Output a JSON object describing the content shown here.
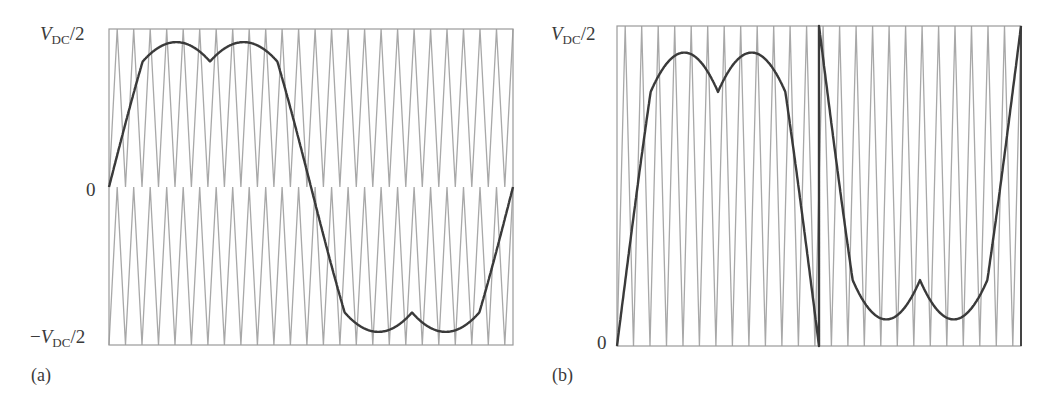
{
  "chart_data": [
    {
      "panel": "(a)",
      "type": "line",
      "title": "",
      "xlabel": "",
      "ylabel": "",
      "yticks": [
        "V_DC/2",
        "0",
        "-V_DC/2"
      ],
      "ylim": [
        -1,
        1
      ],
      "grid": false,
      "carrier": {
        "kind": "level-shifted triangular carriers (phase disposition)",
        "count": 2,
        "bands": [
          [
            0,
            1
          ],
          [
            -1,
            0
          ]
        ],
        "periods_across_plot": 24.5
      },
      "reference": {
        "description": "modulating signal with min-max (third-harmonic-like) injection over one fundamental period",
        "peak": 0.917,
        "cusp_value": 0.795,
        "key_points_deg": [
          0,
          30,
          60,
          90,
          120,
          150,
          180,
          210,
          240,
          270,
          300,
          330,
          360
        ],
        "key_points_value": [
          0,
          0.795,
          0.917,
          0.795,
          0.917,
          0.795,
          0,
          -0.795,
          -0.917,
          -0.795,
          -0.917,
          -0.795,
          0
        ]
      }
    },
    {
      "panel": "(b)",
      "type": "line",
      "title": "",
      "xlabel": "",
      "ylabel": "",
      "yticks": [
        "V_DC/2",
        "0"
      ],
      "ylim": [
        0,
        1
      ],
      "grid": false,
      "carrier": {
        "kind": "single triangular carrier",
        "count": 1,
        "bands": [
          [
            0,
            1
          ]
        ],
        "periods_across_plot": 24.5
      },
      "reference": {
        "description": "rectified/folded reference: first half f(θ), second half 1 − f(θ), vertical reset at mid-period",
        "peak": 0.917,
        "cusp_value": 0.795,
        "key_points_deg": [
          0,
          30,
          60,
          90,
          120,
          150,
          180,
          210,
          240,
          270,
          300,
          330,
          360
        ],
        "key_points_value": [
          0,
          0.795,
          0.917,
          0.795,
          0.917,
          0.795,
          0,
          0.205,
          0.083,
          0.205,
          0.083,
          0.205,
          1
        ]
      }
    }
  ],
  "labels": {
    "a": {
      "top_var": "V",
      "top_sub": "DC",
      "top_rest": "/2",
      "zero": "0",
      "bottom_sign": "−",
      "bottom_var": "V",
      "bottom_sub": "DC",
      "bottom_rest": "/2",
      "tag": "(a)"
    },
    "b": {
      "top_var": "V",
      "top_sub": "DC",
      "top_rest": "/2",
      "zero": "0",
      "tag": "(b)"
    }
  },
  "colors": {
    "frame": "#9a9a9a",
    "carrier": "#a8a8a8",
    "reference": "#3a3a3a",
    "divider": "#444444"
  }
}
